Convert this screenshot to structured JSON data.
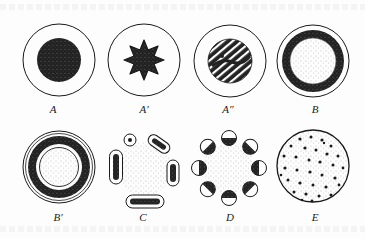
{
  "figure": {
    "colors": {
      "ink": "#1a1a1a",
      "dark_fill": "#262626",
      "stipple": "#9a9a9a",
      "paper": "#fdfdfd"
    },
    "panels": [
      {
        "id": "A",
        "label": "A",
        "description": "circle with solid dark central disc"
      },
      {
        "id": "A1",
        "label": "A′",
        "description": "circle with dark star-shaped center"
      },
      {
        "id": "A2",
        "label": "A″",
        "description": "circle with dark disc crossed by diagonal white stripes"
      },
      {
        "id": "B",
        "label": "B",
        "description": "circle with dark ring around stippled center"
      },
      {
        "id": "B1",
        "label": "B′",
        "description": "double-outlined circle with dark ring, white band and stippled inner circle"
      },
      {
        "id": "C",
        "label": "C",
        "description": "stippled center surrounded by separated dark arc-shaped bundles and one small dot"
      },
      {
        "id": "D",
        "label": "D",
        "description": "stippled center surrounded by eight half-dark small circles"
      },
      {
        "id": "E",
        "label": "E",
        "description": "stippled circle with scattered dark dots"
      }
    ]
  }
}
